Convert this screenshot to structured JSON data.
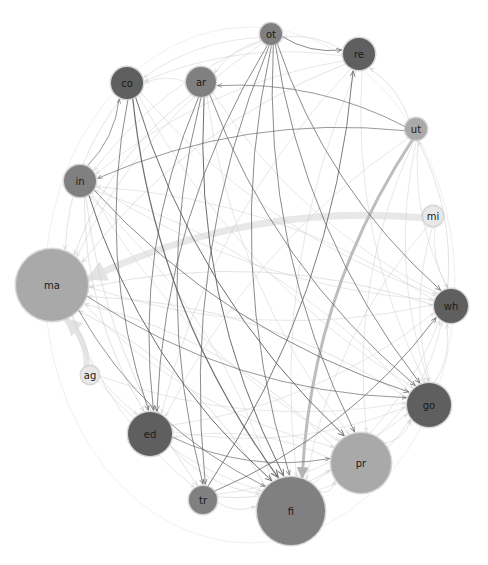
{
  "diagram": {
    "type": "directed-network-circular-layout",
    "colors": {
      "dark_node": "#5f5f5f",
      "medium_node": "#808080",
      "light_node": "#a9a9a9",
      "pale_node": "#e8e8e8",
      "node_stroke": "#c8c8c8",
      "edge_dark": "#555555",
      "edge_light": "#cfcfcf",
      "edge_heavy": "#bdbdbd",
      "edge_ghost": "#e6e6e6"
    },
    "nodes": [
      {
        "id": "ot",
        "label": "ot",
        "x": 271,
        "y": 34,
        "r": 11,
        "shade": "medium_node"
      },
      {
        "id": "re",
        "label": "re",
        "x": 359,
        "y": 54,
        "r": 16,
        "shade": "dark_node"
      },
      {
        "id": "co",
        "label": "co",
        "x": 127,
        "y": 83,
        "r": 16,
        "shade": "dark_node"
      },
      {
        "id": "ar",
        "label": "ar",
        "x": 201,
        "y": 82,
        "r": 15,
        "shade": "medium_node"
      },
      {
        "id": "ut",
        "label": "ut",
        "x": 416,
        "y": 129,
        "r": 11,
        "shade": "light_node"
      },
      {
        "id": "in",
        "label": "in",
        "x": 80,
        "y": 181,
        "r": 16,
        "shade": "medium_node"
      },
      {
        "id": "mi",
        "label": "mi",
        "x": 433,
        "y": 216,
        "r": 10,
        "shade": "pale_node"
      },
      {
        "id": "ma",
        "label": "ma",
        "x": 52,
        "y": 285,
        "r": 36,
        "shade": "light_node"
      },
      {
        "id": "wh",
        "label": "wh",
        "x": 451,
        "y": 306,
        "r": 17,
        "shade": "dark_node"
      },
      {
        "id": "ag",
        "label": "ag",
        "x": 90,
        "y": 375,
        "r": 9,
        "shade": "pale_node"
      },
      {
        "id": "go",
        "label": "go",
        "x": 429,
        "y": 405,
        "r": 22,
        "shade": "dark_node"
      },
      {
        "id": "ed",
        "label": "ed",
        "x": 150,
        "y": 434,
        "r": 22,
        "shade": "dark_node"
      },
      {
        "id": "pr",
        "label": "pr",
        "x": 361,
        "y": 463,
        "r": 30,
        "shade": "light_node"
      },
      {
        "id": "tr",
        "label": "tr",
        "x": 203,
        "y": 500,
        "r": 14,
        "shade": "medium_node"
      },
      {
        "id": "fi",
        "label": "fi",
        "x": 291,
        "y": 511,
        "r": 34,
        "shade": "medium_node"
      }
    ],
    "edges": [
      {
        "from": "mi",
        "to": "ma",
        "weight": "heavy",
        "style": "edge_ghost",
        "width": 7
      },
      {
        "from": "ut",
        "to": "fi",
        "weight": "heavy",
        "style": "edge_heavy",
        "width": 3
      },
      {
        "from": "ag",
        "to": "ma",
        "weight": "heavy",
        "style": "edge_ghost",
        "width": 6
      },
      {
        "from": "co",
        "to": "fi",
        "weight": "strong",
        "style": "edge_dark",
        "width": 1.2
      },
      {
        "from": "co",
        "to": "pr",
        "weight": "strong",
        "style": "edge_dark",
        "width": 1
      },
      {
        "from": "co",
        "to": "ed",
        "weight": "medium",
        "style": "edge_dark",
        "width": 0.8
      },
      {
        "from": "ar",
        "to": "fi",
        "weight": "strong",
        "style": "edge_dark",
        "width": 1
      },
      {
        "from": "ar",
        "to": "tr",
        "weight": "medium",
        "style": "edge_dark",
        "width": 0.8
      },
      {
        "from": "ar",
        "to": "ed",
        "weight": "medium",
        "style": "edge_dark",
        "width": 0.8
      },
      {
        "from": "ar",
        "to": "go",
        "weight": "medium",
        "style": "edge_dark",
        "width": 0.8
      },
      {
        "from": "ot",
        "to": "re",
        "weight": "medium",
        "style": "edge_dark",
        "width": 0.8
      },
      {
        "from": "ot",
        "to": "fi",
        "weight": "medium",
        "style": "edge_dark",
        "width": 0.8
      },
      {
        "from": "ot",
        "to": "pr",
        "weight": "medium",
        "style": "edge_dark",
        "width": 0.8
      },
      {
        "from": "ot",
        "to": "go",
        "weight": "medium",
        "style": "edge_dark",
        "width": 0.8
      },
      {
        "from": "ot",
        "to": "tr",
        "weight": "medium",
        "style": "edge_dark",
        "width": 0.8
      },
      {
        "from": "ot",
        "to": "ed",
        "weight": "medium",
        "style": "edge_dark",
        "width": 0.8
      },
      {
        "from": "ot",
        "to": "wh",
        "weight": "medium",
        "style": "edge_dark",
        "width": 0.8
      },
      {
        "from": "ut",
        "to": "in",
        "weight": "medium",
        "style": "edge_dark",
        "width": 0.7
      },
      {
        "from": "ut",
        "to": "ar",
        "weight": "medium",
        "style": "edge_dark",
        "width": 0.7
      },
      {
        "from": "tr",
        "to": "re",
        "weight": "medium",
        "style": "edge_dark",
        "width": 0.9
      },
      {
        "from": "tr",
        "to": "wh",
        "weight": "medium",
        "style": "edge_dark",
        "width": 0.8
      },
      {
        "from": "in",
        "to": "fi",
        "weight": "strong",
        "style": "edge_dark",
        "width": 1
      },
      {
        "from": "in",
        "to": "go",
        "weight": "medium",
        "style": "edge_dark",
        "width": 0.8
      },
      {
        "from": "in",
        "to": "co",
        "weight": "medium",
        "style": "edge_dark",
        "width": 0.7
      },
      {
        "from": "ma",
        "to": "go",
        "weight": "medium",
        "style": "edge_dark",
        "width": 0.7
      },
      {
        "from": "ma",
        "to": "fi",
        "weight": "medium",
        "style": "edge_dark",
        "width": 0.7
      },
      {
        "from": "ed",
        "to": "pr",
        "weight": "medium",
        "style": "edge_dark",
        "width": 0.7
      },
      {
        "from": "re",
        "to": "ma",
        "weight": "light",
        "style": "edge_light",
        "width": 0.7
      },
      {
        "from": "co",
        "to": "ma",
        "weight": "light",
        "style": "edge_light",
        "width": 0.7
      },
      {
        "from": "ar",
        "to": "ma",
        "weight": "light",
        "style": "edge_light",
        "width": 0.7
      },
      {
        "from": "wh",
        "to": "ma",
        "weight": "light",
        "style": "edge_light",
        "width": 0.7
      },
      {
        "from": "go",
        "to": "ma",
        "weight": "light",
        "style": "edge_light",
        "width": 0.7
      },
      {
        "from": "fi",
        "to": "ma",
        "weight": "light",
        "style": "edge_light",
        "width": 0.7
      },
      {
        "from": "pr",
        "to": "ma",
        "weight": "light",
        "style": "edge_light",
        "width": 0.7
      },
      {
        "from": "in",
        "to": "ed",
        "weight": "light",
        "style": "edge_light",
        "width": 0.7
      },
      {
        "from": "in",
        "to": "tr",
        "weight": "light",
        "style": "edge_light",
        "width": 0.7
      },
      {
        "from": "ed",
        "to": "fi",
        "weight": "light",
        "style": "edge_light",
        "width": 0.7
      },
      {
        "from": "tr",
        "to": "fi",
        "weight": "light",
        "style": "edge_light",
        "width": 0.7
      },
      {
        "from": "tr",
        "to": "pr",
        "weight": "light",
        "style": "edge_light",
        "width": 0.7
      },
      {
        "from": "fi",
        "to": "pr",
        "weight": "light",
        "style": "edge_light",
        "width": 0.7
      },
      {
        "from": "pr",
        "to": "go",
        "weight": "light",
        "style": "edge_light",
        "width": 0.7
      },
      {
        "from": "go",
        "to": "wh",
        "weight": "light",
        "style": "edge_light",
        "width": 0.7
      },
      {
        "from": "wh",
        "to": "ut",
        "weight": "light",
        "style": "edge_light",
        "width": 0.7
      },
      {
        "from": "ut",
        "to": "re",
        "weight": "light",
        "style": "edge_light",
        "width": 0.7
      },
      {
        "from": "re",
        "to": "ot",
        "weight": "light",
        "style": "edge_light",
        "width": 0.6
      },
      {
        "from": "ot",
        "to": "ar",
        "weight": "light",
        "style": "edge_light",
        "width": 0.6
      },
      {
        "from": "ar",
        "to": "co",
        "weight": "light",
        "style": "edge_light",
        "width": 0.6
      },
      {
        "from": "re",
        "to": "co",
        "weight": "light",
        "style": "edge_light",
        "width": 0.6
      },
      {
        "from": "ut",
        "to": "wh",
        "weight": "light",
        "style": "edge_light",
        "width": 0.6
      },
      {
        "from": "ut",
        "to": "go",
        "weight": "light",
        "style": "edge_light",
        "width": 0.6
      },
      {
        "from": "ut",
        "to": "pr",
        "weight": "light",
        "style": "edge_light",
        "width": 0.6
      },
      {
        "from": "ut",
        "to": "ed",
        "weight": "light",
        "style": "edge_light",
        "width": 0.6
      },
      {
        "from": "re",
        "to": "fi",
        "weight": "light",
        "style": "edge_light",
        "width": 0.6
      },
      {
        "from": "re",
        "to": "go",
        "weight": "light",
        "style": "edge_light",
        "width": 0.6
      },
      {
        "from": "re",
        "to": "ed",
        "weight": "light",
        "style": "edge_light",
        "width": 0.6
      },
      {
        "from": "co",
        "to": "wh",
        "weight": "light",
        "style": "edge_light",
        "width": 0.6
      },
      {
        "from": "co",
        "to": "go",
        "weight": "light",
        "style": "edge_light",
        "width": 0.6
      },
      {
        "from": "ar",
        "to": "wh",
        "weight": "light",
        "style": "edge_light",
        "width": 0.6
      },
      {
        "from": "ar",
        "to": "pr",
        "weight": "light",
        "style": "edge_light",
        "width": 0.6
      },
      {
        "from": "in",
        "to": "wh",
        "weight": "light",
        "style": "edge_light",
        "width": 0.6
      },
      {
        "from": "in",
        "to": "pr",
        "weight": "light",
        "style": "edge_light",
        "width": 0.6
      },
      {
        "from": "ma",
        "to": "wh",
        "weight": "light",
        "style": "edge_light",
        "width": 0.6
      },
      {
        "from": "ma",
        "to": "pr",
        "weight": "light",
        "style": "edge_light",
        "width": 0.6
      },
      {
        "from": "ma",
        "to": "ed",
        "weight": "light",
        "style": "edge_light",
        "width": 0.6
      },
      {
        "from": "ma",
        "to": "tr",
        "weight": "light",
        "style": "edge_light",
        "width": 0.6
      },
      {
        "from": "ag",
        "to": "fi",
        "weight": "light",
        "style": "edge_light",
        "width": 0.6
      },
      {
        "from": "ag",
        "to": "go",
        "weight": "light",
        "style": "edge_light",
        "width": 0.6
      },
      {
        "from": "ed",
        "to": "go",
        "weight": "light",
        "style": "edge_light",
        "width": 0.6
      },
      {
        "from": "ed",
        "to": "wh",
        "weight": "light",
        "style": "edge_light",
        "width": 0.6
      },
      {
        "from": "tr",
        "to": "go",
        "weight": "light",
        "style": "edge_light",
        "width": 0.6
      },
      {
        "from": "fi",
        "to": "go",
        "weight": "light",
        "style": "edge_light",
        "width": 0.6
      },
      {
        "from": "fi",
        "to": "wh",
        "weight": "light",
        "style": "edge_light",
        "width": 0.6
      },
      {
        "from": "pr",
        "to": "wh",
        "weight": "light",
        "style": "edge_light",
        "width": 0.6
      },
      {
        "from": "mi",
        "to": "wh",
        "weight": "light",
        "style": "edge_light",
        "width": 0.6
      },
      {
        "from": "mi",
        "to": "go",
        "weight": "light",
        "style": "edge_light",
        "width": 0.6
      },
      {
        "from": "mi",
        "to": "fi",
        "weight": "light",
        "style": "edge_light",
        "width": 0.6
      },
      {
        "from": "ot",
        "to": "co",
        "weight": "light",
        "style": "edge_light",
        "width": 0.6
      },
      {
        "from": "ot",
        "to": "in",
        "weight": "light",
        "style": "edge_light",
        "width": 0.6
      },
      {
        "from": "ot",
        "to": "ma",
        "weight": "light",
        "style": "edge_light",
        "width": 0.6
      },
      {
        "from": "re",
        "to": "in",
        "weight": "light",
        "style": "edge_light",
        "width": 0.6
      },
      {
        "from": "wh",
        "to": "in",
        "weight": "light",
        "style": "edge_light",
        "width": 0.6
      },
      {
        "from": "go",
        "to": "in",
        "weight": "light",
        "style": "edge_light",
        "width": 0.6
      },
      {
        "from": "fi",
        "to": "in",
        "weight": "light",
        "style": "edge_light",
        "width": 0.6
      },
      {
        "from": "pr",
        "to": "ed",
        "weight": "light",
        "style": "edge_light",
        "width": 0.6
      }
    ]
  }
}
